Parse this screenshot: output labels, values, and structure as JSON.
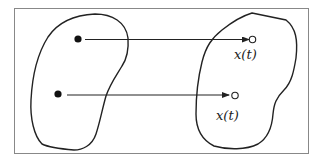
{
  "diagram": {
    "colors": {
      "stroke": "#222222",
      "frame": "#888888",
      "background": "#ffffff"
    },
    "labels": {
      "upper_target": "x(t)",
      "lower_target": "x(t)"
    },
    "regions": [
      {
        "name": "initial-region"
      },
      {
        "name": "evolved-region"
      }
    ],
    "points": [
      {
        "name": "upper-initial-point",
        "style": "filled"
      },
      {
        "name": "lower-initial-point",
        "style": "filled"
      },
      {
        "name": "upper-target-point",
        "style": "open"
      },
      {
        "name": "lower-target-point",
        "style": "open"
      }
    ],
    "arrows": [
      {
        "from": "upper-initial-point",
        "to": "upper-target-point"
      },
      {
        "from": "lower-initial-point",
        "to": "lower-target-point"
      }
    ]
  }
}
